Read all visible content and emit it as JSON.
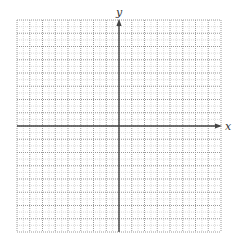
{
  "diagram": {
    "type": "coordinate-plane",
    "grid": {
      "left": 17,
      "top": 20,
      "right": 221,
      "bottom": 232,
      "major_divisions_x": 16,
      "major_divisions_y": 16,
      "minor_per_major": 2,
      "major_color": "#9a9a9a",
      "minor_color": "#d0d0d0"
    },
    "axes": {
      "color": "#444444",
      "x_axis": {
        "label": "x",
        "has_arrow": true,
        "arrow_direction": "right"
      },
      "y_axis": {
        "label": "y",
        "has_arrow": true,
        "arrow_direction": "up"
      },
      "origin_index": {
        "col": 8,
        "row": 8
      }
    }
  }
}
